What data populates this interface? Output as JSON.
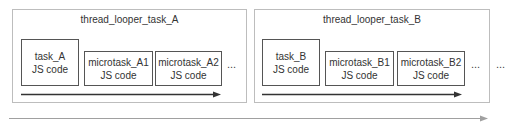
{
  "diagram": {
    "threads": [
      {
        "title": "thread_looper_task_A",
        "tasks": [
          {
            "name": "task_A",
            "code": "JS code"
          },
          {
            "name": "microtask_A1",
            "code": "JS code"
          },
          {
            "name": "microtask_A2",
            "code": "JS code"
          }
        ],
        "ellipsis": "..."
      },
      {
        "title": "thread_looper_task_B",
        "tasks": [
          {
            "name": "task_B",
            "code": "JS code"
          },
          {
            "name": "microtask_B1",
            "code": "JS code"
          },
          {
            "name": "microtask_B2",
            "code": "JS code"
          }
        ],
        "ellipsis": "..."
      }
    ],
    "trailing_ellipsis": "...",
    "colors": {
      "outer_border": "#bdbdbd",
      "box_border": "#555555",
      "inner_arrow": "#333333",
      "timeline_arrow": "#9e9e9e"
    }
  }
}
